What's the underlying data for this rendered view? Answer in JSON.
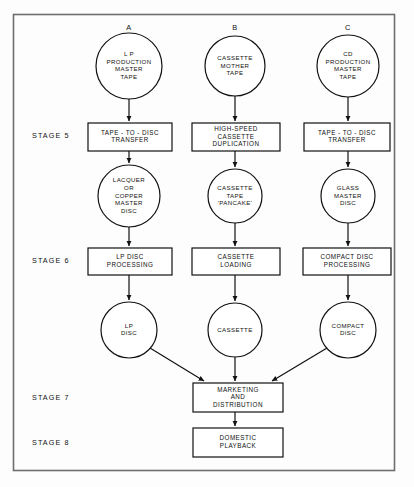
{
  "diagram": {
    "frame_color": "#6e6e6e",
    "line_color": "#111111",
    "background": "#fdfdfd",
    "column_labels": [
      {
        "id": "A",
        "label": "A",
        "x": 129,
        "y": 28
      },
      {
        "id": "B",
        "label": "B",
        "x": 235,
        "y": 28
      },
      {
        "id": "C",
        "label": "C",
        "x": 348,
        "y": 28
      }
    ],
    "stage_labels": [
      {
        "id": "stage-5",
        "label": "STAGE 5",
        "x": 32,
        "y": 136
      },
      {
        "id": "stage-6",
        "label": "STAGE 6",
        "x": 32,
        "y": 261
      },
      {
        "id": "stage-7",
        "label": "STAGE 7",
        "x": 32,
        "y": 398
      },
      {
        "id": "stage-8",
        "label": "STAGE 8",
        "x": 32,
        "y": 443
      }
    ],
    "circles": [
      {
        "id": "lp-production-master-tape",
        "name": "lp-production-master-tape-circle",
        "cx": 129,
        "cy": 66,
        "r": 33,
        "lines": [
          "L P",
          "PRODUCTION",
          "MASTER",
          "TAPE"
        ]
      },
      {
        "id": "cassette-mother-tape",
        "name": "cassette-mother-tape-circle",
        "cx": 235,
        "cy": 66,
        "r": 30,
        "lines": [
          "CASSETTE",
          "MOTHER",
          "TAPE"
        ]
      },
      {
        "id": "cd-production-master-tape",
        "name": "cd-production-master-tape-circle",
        "cx": 348,
        "cy": 66,
        "r": 31,
        "lines": [
          "CD",
          "PRODUCTION",
          "MASTER",
          "TAPE"
        ]
      },
      {
        "id": "lacquer-or-copper-master-disc",
        "name": "lacquer-or-copper-master-disc-circle",
        "cx": 129,
        "cy": 196,
        "r": 31,
        "lines": [
          "LACQUER",
          "OR",
          "COPPER",
          "MASTER",
          "DISC"
        ]
      },
      {
        "id": "cassette-tape-pancake",
        "name": "cassette-tape-pancake-circle",
        "cx": 235,
        "cy": 196,
        "r": 27,
        "lines": [
          "CASSETTE",
          "TAPE",
          "'PANCAKE'"
        ]
      },
      {
        "id": "glass-master-disc",
        "name": "glass-master-disc-circle",
        "cx": 348,
        "cy": 196,
        "r": 27,
        "lines": [
          "GLASS",
          "MASTER",
          "DISC"
        ]
      },
      {
        "id": "lp-disc",
        "name": "lp-disc-circle",
        "cx": 129,
        "cy": 330,
        "r": 28,
        "lines": [
          "LP",
          "DISC"
        ]
      },
      {
        "id": "cassette",
        "name": "cassette-circle",
        "cx": 235,
        "cy": 330,
        "r": 27,
        "lines": [
          "CASSETTE"
        ]
      },
      {
        "id": "compact-disc",
        "name": "compact-disc-circle",
        "cx": 348,
        "cy": 330,
        "r": 28,
        "lines": [
          "COMPACT",
          "DISC"
        ]
      }
    ],
    "boxes": [
      {
        "id": "tape-to-disc-transfer-a",
        "name": "tape-to-disc-transfer-a-box",
        "x": 88,
        "y": 123,
        "w": 84,
        "h": 28,
        "lines": [
          "TAPE - TO - DISC",
          "TRANSFER"
        ]
      },
      {
        "id": "high-speed-cassette-duplication",
        "name": "high-speed-cassette-duplication-box",
        "x": 192,
        "y": 123,
        "w": 88,
        "h": 28,
        "lines": [
          "HIGH-SPEED",
          "CASSETTE",
          "DUPLICATION"
        ]
      },
      {
        "id": "tape-to-disc-transfer-c",
        "name": "tape-to-disc-transfer-c-box",
        "x": 304,
        "y": 123,
        "w": 86,
        "h": 28,
        "lines": [
          "TAPE - TO - DISC",
          "TRANSFER"
        ]
      },
      {
        "id": "lp-disc-processing",
        "name": "lp-disc-processing-box",
        "x": 88,
        "y": 248,
        "w": 84,
        "h": 27,
        "lines": [
          "LP  DISC",
          "PROCESSING"
        ]
      },
      {
        "id": "cassette-loading",
        "name": "cassette-loading-box",
        "x": 192,
        "y": 248,
        "w": 88,
        "h": 27,
        "lines": [
          "CASSETTE",
          "LOADING"
        ]
      },
      {
        "id": "compact-disc-processing",
        "name": "compact-disc-processing-box",
        "x": 303,
        "y": 248,
        "w": 88,
        "h": 27,
        "lines": [
          "COMPACT  DISC",
          "PROCESSING"
        ]
      },
      {
        "id": "marketing-and-distribution",
        "name": "marketing-and-distribution-box",
        "x": 193,
        "y": 383,
        "w": 90,
        "h": 29,
        "lines": [
          "MARKETING",
          "AND",
          "DISTRIBUTION"
        ]
      },
      {
        "id": "domestic-playback",
        "name": "domestic-playback-box",
        "x": 193,
        "y": 428,
        "w": 90,
        "h": 29,
        "lines": [
          "DOMESTIC",
          "PLAYBACK"
        ]
      }
    ],
    "connectors": [
      {
        "id": "conn-a1",
        "name": "connector-lp-tape-to-transfer",
        "from": "lp-production-master-tape",
        "to": "tape-to-disc-transfer-a",
        "path": "M129,99 L129,121",
        "arrow": true
      },
      {
        "id": "conn-b1",
        "name": "connector-cassette-tape-to-duplication",
        "from": "cassette-mother-tape",
        "to": "high-speed-cassette-duplication",
        "path": "M235,96 L235,121",
        "arrow": true
      },
      {
        "id": "conn-c1",
        "name": "connector-cd-tape-to-transfer",
        "from": "cd-production-master-tape",
        "to": "tape-to-disc-transfer-c",
        "path": "M348,97 L348,121",
        "arrow": true
      },
      {
        "id": "conn-a2",
        "name": "connector-transfer-to-lacquer",
        "from": "tape-to-disc-transfer-a",
        "to": "lacquer-or-copper-master-disc",
        "path": "M129,151 L129,163",
        "arrow": true
      },
      {
        "id": "conn-b2",
        "name": "connector-duplication-to-pancake",
        "from": "high-speed-cassette-duplication",
        "to": "cassette-tape-pancake",
        "path": "M235,151 L235,167",
        "arrow": true
      },
      {
        "id": "conn-c2",
        "name": "connector-transfer-to-glass-master",
        "from": "tape-to-disc-transfer-c",
        "to": "glass-master-disc",
        "path": "M348,151 L348,167",
        "arrow": true
      },
      {
        "id": "conn-a3",
        "name": "connector-lacquer-to-lp-processing",
        "from": "lacquer-or-copper-master-disc",
        "to": "lp-disc-processing",
        "path": "M129,227 L129,246",
        "arrow": true
      },
      {
        "id": "conn-b3",
        "name": "connector-pancake-to-cassette-loading",
        "from": "cassette-tape-pancake",
        "to": "cassette-loading",
        "path": "M235,223 L235,246",
        "arrow": true
      },
      {
        "id": "conn-c3",
        "name": "connector-glass-master-to-cd-processing",
        "from": "glass-master-disc",
        "to": "compact-disc-processing",
        "path": "M348,223 L348,246",
        "arrow": true
      },
      {
        "id": "conn-a4",
        "name": "connector-lp-processing-to-lp-disc",
        "from": "lp-disc-processing",
        "to": "lp-disc",
        "path": "M129,275 L129,300",
        "arrow": true
      },
      {
        "id": "conn-b4",
        "name": "connector-cassette-loading-to-cassette",
        "from": "cassette-loading",
        "to": "cassette",
        "path": "M235,275 L235,301",
        "arrow": true
      },
      {
        "id": "conn-c4",
        "name": "connector-cd-processing-to-compact-disc",
        "from": "compact-disc-processing",
        "to": "compact-disc",
        "path": "M348,275 L348,300",
        "arrow": true
      },
      {
        "id": "conn-a5",
        "name": "connector-lp-disc-to-marketing",
        "from": "lp-disc",
        "to": "marketing-and-distribution",
        "path": "M150,348 L204,381",
        "arrow": true
      },
      {
        "id": "conn-b5",
        "name": "connector-cassette-to-marketing",
        "from": "cassette",
        "to": "marketing-and-distribution",
        "path": "M235,357 L235,381",
        "arrow": true
      },
      {
        "id": "conn-c5",
        "name": "connector-compact-disc-to-marketing",
        "from": "compact-disc",
        "to": "marketing-and-distribution",
        "path": "M327,348 L272,381",
        "arrow": true
      },
      {
        "id": "conn-final",
        "name": "connector-marketing-to-playback",
        "from": "marketing-and-distribution",
        "to": "domestic-playback",
        "path": "M235,412 L235,426",
        "arrow": true
      }
    ]
  }
}
